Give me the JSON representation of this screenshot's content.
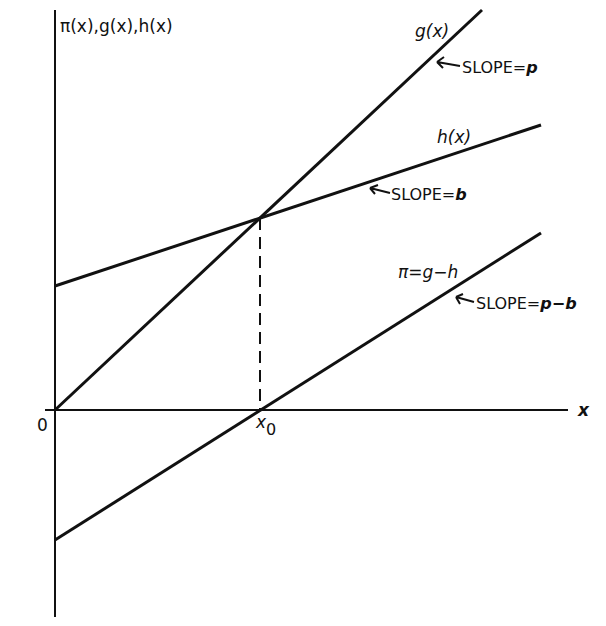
{
  "diagram": {
    "y_axis_label": "π(x),g(x),h(x)",
    "x_axis_label": "x",
    "origin_label": "0",
    "x0_label": "x",
    "x0_subscript": "0",
    "lines": [
      {
        "id": "g",
        "label": "g(x)",
        "slope_label": "SLOPE = p",
        "from": [
          55,
          410
        ],
        "to": [
          482,
          10
        ]
      },
      {
        "id": "h",
        "label": "h(x)",
        "slope_label": "SLOPE = b",
        "from": [
          55,
          286
        ],
        "to": [
          541,
          125
        ]
      },
      {
        "id": "pi",
        "label": "π = g − h",
        "slope_label": "SLOPE = p − b",
        "from": [
          55,
          540
        ],
        "to": [
          541,
          233
        ]
      }
    ],
    "intersection": {
      "x": 260,
      "y": 218
    },
    "axes": {
      "y_axis": {
        "x": 55,
        "top": 10,
        "bottom": 617
      },
      "x_axis": {
        "y": 410,
        "left": 45,
        "right": 568
      }
    },
    "colors": {
      "ink": "#111111",
      "background": "#ffffff"
    }
  },
  "labels": {
    "g": "g(x)",
    "h": "h(x)",
    "pi": "π=g−h",
    "slope_g": "SLOPE=",
    "slope_g_var": "p",
    "slope_h": "SLOPE=",
    "slope_h_var": "b",
    "slope_pi": "SLOPE=",
    "slope_pi_var": "p−b"
  }
}
